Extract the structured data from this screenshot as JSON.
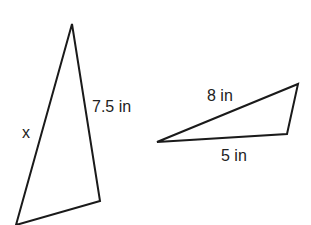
{
  "diagram": {
    "stroke_color": "#1a1a1a",
    "triangle_left": {
      "vertices": [
        [
          72,
          24
        ],
        [
          100,
          201
        ],
        [
          16,
          225
        ]
      ],
      "labels": {
        "side_left": "x",
        "side_right": "7.5 in"
      }
    },
    "triangle_right": {
      "vertices": [
        [
          157,
          142
        ],
        [
          298,
          84
        ],
        [
          287,
          134
        ]
      ],
      "labels": {
        "side_top": "8 in",
        "side_bottom": "5 in"
      }
    }
  }
}
